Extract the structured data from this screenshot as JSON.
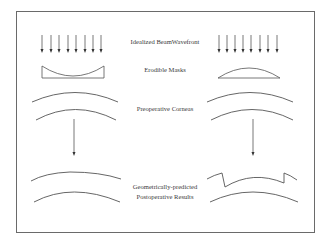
{
  "diagram": {
    "type": "schematic",
    "stroke_color": "#555555",
    "frame_color": "#6a6a6a",
    "labels": {
      "beam": "Idealized BeamWavefront",
      "masks": "Erodible Masks",
      "corneas": "Preoperative Corneas",
      "result_line1": "Geometrically-predicted",
      "result_line2": "Postoperative Results"
    },
    "columns": [
      {
        "name": "left",
        "mask_shape": "concave",
        "arrow_count": 8,
        "result": "flattened cornea"
      },
      {
        "name": "right",
        "mask_shape": "convex",
        "arrow_count": 8,
        "result": "steepened cornea with step edges"
      }
    ]
  }
}
